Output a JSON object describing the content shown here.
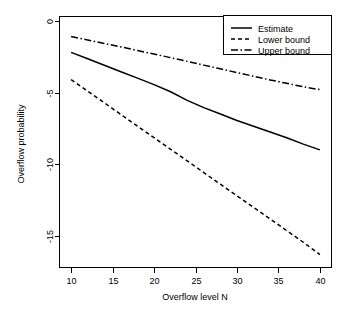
{
  "chart_data": {
    "type": "line",
    "title": "",
    "xlabel": "Overflow level N",
    "ylabel": "Overflow probability",
    "xlim": [
      8.6,
      41.4
    ],
    "ylim": [
      -17.2,
      0.3
    ],
    "grid": false,
    "legend_position": "top-right",
    "xticks": [
      10,
      15,
      20,
      25,
      30,
      35,
      40
    ],
    "xtick_labels": [
      "10",
      "15",
      "20",
      "25",
      "30",
      "35",
      "40"
    ],
    "yticks": [
      0,
      -5,
      -10,
      -15
    ],
    "ytick_labels": [
      "0",
      "-5",
      "-10",
      "-15"
    ],
    "x": [
      10,
      12,
      14,
      16,
      18,
      20,
      22,
      24,
      26,
      28,
      30,
      32,
      34,
      36,
      38,
      40
    ],
    "series": [
      {
        "name": "Estimate",
        "style": "solid",
        "values": [
          -2.2,
          -2.65,
          -3.1,
          -3.55,
          -4.0,
          -4.45,
          -4.95,
          -5.55,
          -6.05,
          -6.5,
          -6.95,
          -7.35,
          -7.75,
          -8.15,
          -8.6,
          -9.0
        ]
      },
      {
        "name": "Lower bound",
        "style": "dashed",
        "values": [
          -4.1,
          -4.91,
          -5.72,
          -6.53,
          -7.34,
          -8.15,
          -8.96,
          -9.77,
          -10.58,
          -11.39,
          -12.2,
          -13.01,
          -13.82,
          -14.63,
          -15.44,
          -16.3
        ]
      },
      {
        "name": "Upper bound",
        "style": "dash-dot",
        "values": [
          -1.1,
          -1.34,
          -1.58,
          -1.82,
          -2.07,
          -2.32,
          -2.57,
          -2.83,
          -3.09,
          -3.35,
          -3.61,
          -3.87,
          -4.12,
          -4.36,
          -4.6,
          -4.8
        ]
      }
    ]
  },
  "legend": {
    "entries": [
      {
        "label": "Estimate"
      },
      {
        "label": "Lower bound"
      },
      {
        "label": "Upper bound"
      }
    ]
  },
  "colors": {
    "line": "#000000",
    "background": "#ffffff",
    "axis": "#000000"
  }
}
